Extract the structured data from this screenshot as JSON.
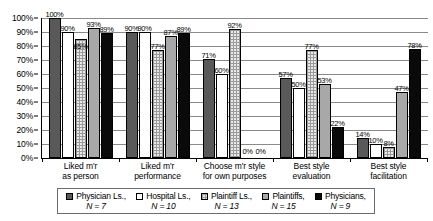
{
  "chart_data": {
    "type": "bar",
    "title": "",
    "xlabel": "",
    "ylabel": "",
    "ylim": [
      0,
      100
    ],
    "grid": true,
    "legend_position": "bottom",
    "categories": [
      "Liked m'r\nas person",
      "Liked m'r\nperformance",
      "Choose m'r style\nfor own purposes",
      "Best style\nevaluation",
      "Best style\nfacilitation"
    ],
    "category_lines": [
      [
        "Liked m'r",
        "as person"
      ],
      [
        "Liked m'r",
        "performance"
      ],
      [
        "Choose m'r style",
        "for own purposes"
      ],
      [
        "Best style",
        "evaluation"
      ],
      [
        "Best style",
        "facilitation"
      ]
    ],
    "ytick_labels": [
      "100%",
      "90%",
      "80%",
      "70%",
      "60%",
      "50%",
      "40%",
      "30%",
      "20%",
      "10%",
      "0%"
    ],
    "ytick_values": [
      100,
      90,
      80,
      70,
      60,
      50,
      40,
      30,
      20,
      10,
      0
    ],
    "series": [
      {
        "name": "Physician Ls.",
        "n_label": "N = 7",
        "color": "#595959",
        "pattern": "solid-dark-gray",
        "values": [
          100,
          90,
          71,
          57,
          14
        ],
        "labels": [
          "100%",
          "90%",
          "71%",
          "57%",
          "14%"
        ]
      },
      {
        "name": "Hospital Ls.",
        "n_label": "N = 10",
        "color": "#ffffff",
        "pattern": "solid-white",
        "values": [
          90,
          90,
          60,
          50,
          10
        ],
        "labels": [
          "90%",
          "90%",
          "60%",
          "50%",
          "10%"
        ]
      },
      {
        "name": "Plaintiff Ls.",
        "n_label": "N = 13",
        "color": "#e9e9e9",
        "pattern": "cross-hatch",
        "values": [
          85,
          77,
          92,
          77,
          8
        ],
        "labels": [
          "85%",
          "77%",
          "92%",
          "77%",
          "8%"
        ]
      },
      {
        "name": "Plaintiffs",
        "n_label": "N = 15",
        "color": "#a8a8a8",
        "pattern": "solid-medium-gray",
        "values": [
          93,
          87,
          0,
          53,
          47
        ],
        "labels": [
          "93%",
          "87%",
          "0%",
          "53%",
          "47%"
        ]
      },
      {
        "name": "Physicians",
        "n_label": "N = 9",
        "color": "#0a0a0a",
        "pattern": "solid-black",
        "values": [
          89,
          89,
          0,
          22,
          78
        ],
        "labels": [
          "89%",
          "89%",
          "0%",
          "22%",
          "78%"
        ]
      }
    ]
  }
}
